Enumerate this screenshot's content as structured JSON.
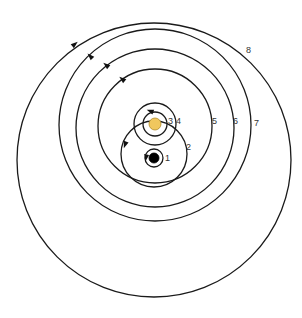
{
  "diagram": {
    "title": "",
    "colors": {
      "line": "#1a1a1a",
      "sun": "#f0c75e",
      "earth": "#000000",
      "background": "#ffffff"
    },
    "bodies": [
      {
        "name": "earth",
        "cx": 154,
        "cy": 158,
        "r": 5,
        "color": "#000000"
      },
      {
        "name": "sun",
        "cx": 155,
        "cy": 124,
        "r": 6,
        "color": "#f0c75e"
      }
    ],
    "orbits": [
      {
        "label": "1",
        "cx": 154,
        "cy": 158,
        "r": 9,
        "label_x": 165,
        "label_y": 161
      },
      {
        "label": "2",
        "cx": 154,
        "cy": 154,
        "r": 33,
        "label_x": 186,
        "label_y": 150
      },
      {
        "label": "3",
        "cx": 155,
        "cy": 124,
        "r": 12,
        "label_x": 168,
        "label_y": 124
      },
      {
        "label": "4",
        "cx": 155,
        "cy": 124,
        "r": 21,
        "label_x": 176,
        "label_y": 124
      },
      {
        "label": "5",
        "cx": 155,
        "cy": 126,
        "r": 57,
        "label_x": 212,
        "label_y": 124
      },
      {
        "label": "6",
        "cx": 155,
        "cy": 128,
        "r": 79,
        "label_x": 233,
        "label_y": 124
      },
      {
        "label": "7",
        "cx": 155,
        "cy": 125,
        "r": 96,
        "label_x": 254,
        "label_y": 126
      },
      {
        "label": "8",
        "cx": 154,
        "cy": 160,
        "r": 137,
        "label_x": 246,
        "label_y": 53
      }
    ],
    "arrows": [
      {
        "orbit": "1",
        "x": 146,
        "y": 158,
        "angle": 100
      },
      {
        "orbit": "2",
        "x": 125,
        "y": 145,
        "angle": 110
      },
      {
        "orbit": "4",
        "x": 150,
        "y": 111,
        "angle": 200
      },
      {
        "orbit": "5",
        "x": 122,
        "y": 79,
        "angle": 220
      },
      {
        "orbit": "6",
        "x": 106,
        "y": 65,
        "angle": 220
      },
      {
        "orbit": "7",
        "x": 90,
        "y": 56,
        "angle": 225
      },
      {
        "orbit": "8",
        "x": 75,
        "y": 44,
        "angle": 320
      }
    ]
  }
}
